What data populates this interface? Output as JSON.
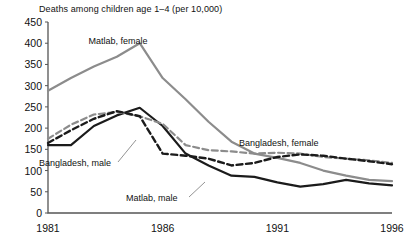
{
  "chart_data": {
    "type": "line",
    "title": "Deaths among children age 1–4 (per 10,000)",
    "xlabel": "",
    "ylabel": "",
    "xlim": [
      1981,
      1996
    ],
    "ylim": [
      0,
      450
    ],
    "ytick_step": 50,
    "grid": false,
    "legend": "annotations-on-plot",
    "yticks": [
      "450",
      "400",
      "350",
      "300",
      "250",
      "200",
      "150",
      "100",
      "50",
      "0"
    ],
    "xticks": [
      "1981",
      "1986",
      "1991",
      "1996"
    ],
    "x": [
      1981,
      1982,
      1983,
      1984,
      1985,
      1986,
      1987,
      1988,
      1989,
      1990,
      1991,
      1992,
      1993,
      1994,
      1995,
      1996
    ],
    "series": [
      {
        "name": "Matlab, female",
        "style": "solid",
        "color": "#8c8c8c",
        "width": 2.2,
        "values": [
          288,
          318,
          345,
          368,
          400,
          318,
          268,
          215,
          168,
          140,
          130,
          118,
          100,
          88,
          78,
          75
        ]
      },
      {
        "name": "Matlab, male",
        "style": "solid",
        "color": "#1b1b1b",
        "width": 2.2,
        "values": [
          160,
          160,
          205,
          230,
          248,
          205,
          140,
          112,
          88,
          85,
          72,
          62,
          68,
          78,
          70,
          65
        ]
      },
      {
        "name": "Bangladesh, female",
        "style": "dashed",
        "color": "#8c8c8c",
        "width": 2.2,
        "values": [
          175,
          208,
          232,
          238,
          228,
          210,
          160,
          148,
          145,
          140,
          142,
          140,
          132,
          128,
          124,
          118
        ]
      },
      {
        "name": "Bangladesh, male",
        "style": "dashed",
        "color": "#1b1b1b",
        "width": 2.4,
        "values": [
          165,
          195,
          222,
          240,
          228,
          140,
          135,
          128,
          112,
          118,
          132,
          138,
          135,
          128,
          122,
          115
        ]
      }
    ],
    "annotations": [
      {
        "text": "Matlab, female",
        "x": 118,
        "y": 44,
        "anchor": "middle"
      },
      {
        "text": "Bangladesh, male",
        "x": 39,
        "y": 166,
        "anchor": "start"
      },
      {
        "text": "Bangladesh, female",
        "x": 239,
        "y": 146,
        "anchor": "start"
      },
      {
        "text": "Matlab, male",
        "x": 126,
        "y": 201,
        "anchor": "start"
      }
    ],
    "leaders": [
      {
        "x1": 118,
        "y1": 162,
        "x2": 136,
        "y2": 140
      },
      {
        "x1": 189,
        "y1": 197,
        "x2": 205,
        "y2": 182
      }
    ]
  }
}
